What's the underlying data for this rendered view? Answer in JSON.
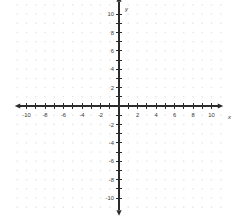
{
  "figure": {
    "width": 242,
    "height": 223,
    "background_color": "#ffffff"
  },
  "chart_data": {
    "type": "scatter",
    "title": "",
    "subtitle": "",
    "xlabel": "x",
    "ylabel": "y",
    "xlim": [
      -11,
      11
    ],
    "ylim": [
      -11,
      11
    ],
    "grid": true,
    "grid_style": "dots",
    "grid_color": "#e8e8e8",
    "legend": null,
    "legend_position": "none",
    "series": [],
    "annotations": [],
    "x_tick_step": 1,
    "y_tick_step": 1,
    "x_label_step": 2,
    "y_label_step": 2,
    "x_ticks": [
      -10,
      -9,
      -8,
      -7,
      -6,
      -5,
      -4,
      -3,
      -2,
      -1,
      1,
      2,
      3,
      4,
      5,
      6,
      7,
      8,
      9,
      10
    ],
    "y_ticks": [
      -10,
      -9,
      -8,
      -7,
      -6,
      -5,
      -4,
      -3,
      -2,
      -1,
      1,
      2,
      3,
      4,
      5,
      6,
      7,
      8,
      9,
      10
    ],
    "x_tick_labels": [
      {
        "value": -10,
        "text": "-10"
      },
      {
        "value": -8,
        "text": "-8"
      },
      {
        "value": -6,
        "text": "-6"
      },
      {
        "value": -4,
        "text": "-4"
      },
      {
        "value": -2,
        "text": "-2"
      },
      {
        "value": 2,
        "text": "2"
      },
      {
        "value": 4,
        "text": "4"
      },
      {
        "value": 6,
        "text": "6"
      },
      {
        "value": 8,
        "text": "8"
      },
      {
        "value": 10,
        "text": "10"
      }
    ],
    "y_tick_labels": [
      {
        "value": 10,
        "text": "10"
      },
      {
        "value": 8,
        "text": "8"
      },
      {
        "value": 6,
        "text": "6"
      },
      {
        "value": 4,
        "text": "4"
      },
      {
        "value": 2,
        "text": "2"
      },
      {
        "value": -2,
        "text": "-2"
      },
      {
        "value": -4,
        "text": "-4"
      },
      {
        "value": -6,
        "text": "-6"
      },
      {
        "value": -8,
        "text": "-8"
      },
      {
        "value": -10,
        "text": "-10"
      }
    ],
    "axis_color": "#2b2b2b",
    "label_color": "#3a3a3a",
    "arrows": {
      "x_left": true,
      "x_right": true,
      "y_top": true,
      "y_bottom": true
    }
  },
  "axes": {
    "x_axis_name": "x",
    "y_axis_name": "y"
  }
}
